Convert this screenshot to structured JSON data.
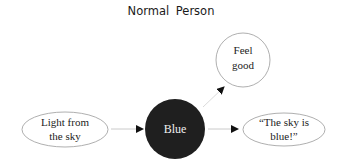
{
  "title": "Normal Person",
  "nodes": {
    "input": {
      "line1": "Light from",
      "line2": "the sky",
      "shape": "ellipse",
      "fill": "#ffffff"
    },
    "center": {
      "label": "Blue",
      "shape": "circle",
      "fill": "#1f1f1f"
    },
    "feel": {
      "line1": "Feel",
      "line2": "good",
      "shape": "circle",
      "fill": "#ffffff"
    },
    "speech": {
      "line1": "“The sky is",
      "line2": "blue!”",
      "shape": "ellipse",
      "fill": "#ffffff"
    }
  },
  "edges": [
    {
      "from": "input",
      "to": "center"
    },
    {
      "from": "center",
      "to": "feel"
    },
    {
      "from": "center",
      "to": "speech"
    }
  ]
}
